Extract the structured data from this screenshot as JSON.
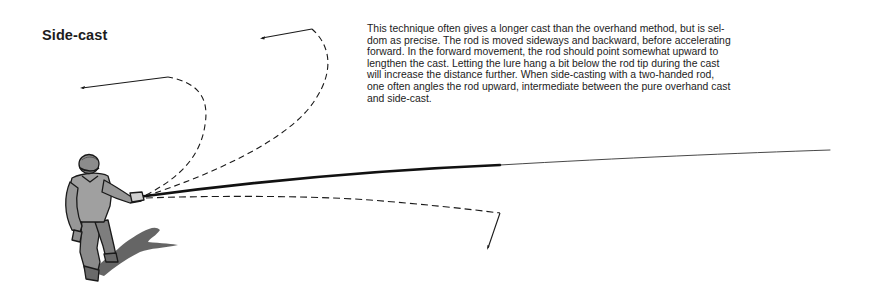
{
  "section": {
    "title": "Side-cast",
    "paragraph_lines": [
      "This technique often gives a longer cast than the overhand method, but is sel-",
      "dom as precise. The rod is moved sideways and backward, before accelerating",
      "forward. In the forward movement, the rod should point somewhat upward to",
      "lengthen the cast. Letting the lure hang a bit below the rod tip during the cast",
      "will increase the distance further. When side-casting with a two-handed rod,",
      "one often angles the rod upward, intermediate between the pure overhand cast",
      "and side-cast."
    ]
  },
  "illustration": {
    "subject": "angler-side-casting",
    "colors": {
      "ink": "#1a1a1a",
      "rod": "#111111",
      "figure_fill": "#9a9a9a",
      "figure_dark": "#5a5a5a",
      "shadow": "#4a4a4a"
    }
  }
}
